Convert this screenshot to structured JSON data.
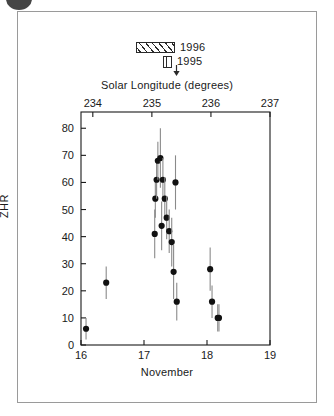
{
  "figure": {
    "legend": {
      "items": [
        {
          "label": "1996",
          "swatch": "hatched-diagonal-box",
          "name": "legend-swatch-1996"
        },
        {
          "label": "1995",
          "swatch": "vertical-striped-box",
          "name": "legend-swatch-1995"
        }
      ],
      "arrow_icon": "down-arrow-icon"
    }
  },
  "chart_data": {
    "type": "scatter",
    "title": "",
    "xlabel": "November",
    "ylabel": "ZHR",
    "top_xlabel": "Solar Longitude (degrees)",
    "xlim": [
      16,
      19
    ],
    "ylim": [
      0,
      86
    ],
    "top_xlim": [
      233.8,
      237.0
    ],
    "grid": false,
    "legend_position": "above-plot-center",
    "xticks": [
      16,
      17,
      18,
      19
    ],
    "xtick_labels": [
      "16",
      "17",
      "18",
      "19"
    ],
    "yticks": [
      0,
      10,
      20,
      30,
      40,
      50,
      60,
      70,
      80
    ],
    "ytick_labels": [
      "0",
      "10",
      "20",
      "30",
      "40",
      "50",
      "60",
      "70",
      "80"
    ],
    "top_xticks": [
      234,
      235,
      236,
      237
    ],
    "top_xtick_labels": [
      "234",
      "235",
      "236",
      "237"
    ],
    "series": [
      {
        "name": "1996 ZHR measurements",
        "marker": "filled-circle",
        "color": "#111111",
        "errorbars": true,
        "points": [
          {
            "x": 16.08,
            "y": 6,
            "yerr_low": 4,
            "yerr_high": 4
          },
          {
            "x": 16.4,
            "y": 23,
            "yerr_low": 6,
            "yerr_high": 6
          },
          {
            "x": 17.17,
            "y": 41,
            "yerr_low": 9,
            "yerr_high": 9
          },
          {
            "x": 17.18,
            "y": 54,
            "yerr_low": 7,
            "yerr_high": 7
          },
          {
            "x": 17.2,
            "y": 61,
            "yerr_low": 7,
            "yerr_high": 7
          },
          {
            "x": 17.22,
            "y": 68,
            "yerr_low": 7,
            "yerr_high": 7
          },
          {
            "x": 17.26,
            "y": 69,
            "yerr_low": 11,
            "yerr_high": 11
          },
          {
            "x": 17.28,
            "y": 44,
            "yerr_low": 9,
            "yerr_high": 9
          },
          {
            "x": 17.3,
            "y": 61,
            "yerr_low": 8,
            "yerr_high": 8
          },
          {
            "x": 17.33,
            "y": 54,
            "yerr_low": 8,
            "yerr_high": 8
          },
          {
            "x": 17.36,
            "y": 47,
            "yerr_low": 8,
            "yerr_high": 8
          },
          {
            "x": 17.4,
            "y": 42,
            "yerr_low": 8,
            "yerr_high": 8
          },
          {
            "x": 17.44,
            "y": 38,
            "yerr_low": 9,
            "yerr_high": 9
          },
          {
            "x": 17.47,
            "y": 27,
            "yerr_low": 10,
            "yerr_high": 10
          },
          {
            "x": 17.5,
            "y": 60,
            "yerr_low": 10,
            "yerr_high": 10
          },
          {
            "x": 17.52,
            "y": 16,
            "yerr_low": 7,
            "yerr_high": 7
          },
          {
            "x": 18.05,
            "y": 28,
            "yerr_low": 8,
            "yerr_high": 8
          },
          {
            "x": 18.08,
            "y": 16,
            "yerr_low": 6,
            "yerr_high": 6
          },
          {
            "x": 18.17,
            "y": 10,
            "yerr_low": 5,
            "yerr_high": 5
          },
          {
            "x": 18.19,
            "y": 10,
            "yerr_low": 5,
            "yerr_high": 5
          }
        ]
      }
    ]
  }
}
